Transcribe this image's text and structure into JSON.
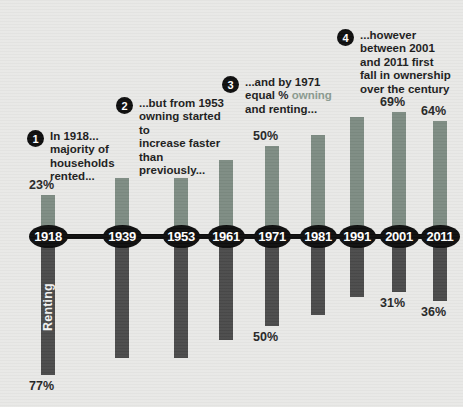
{
  "chart_data": {
    "type": "bar",
    "title": "",
    "subtitle": "",
    "xlabel": "",
    "ylabel": "",
    "categories": [
      "1918",
      "1939",
      "1953",
      "1961",
      "1971",
      "1981",
      "1991",
      "2001",
      "2011"
    ],
    "series": [
      {
        "name": "Owning",
        "values": [
          23,
          32,
          32,
          42,
          50,
          56,
          66,
          69,
          64
        ]
      },
      {
        "name": "Renting",
        "values": [
          77,
          68,
          68,
          58,
          50,
          44,
          34,
          31,
          36
        ]
      }
    ],
    "value_labels": {
      "owning": [
        "23%",
        "",
        "",
        "",
        "50%",
        "",
        "",
        "69%",
        "64%"
      ],
      "renting": [
        "77%",
        "",
        "",
        "",
        "50%",
        "",
        "",
        "31%",
        "36%"
      ]
    },
    "ylim": [
      -100,
      100
    ],
    "grid": false,
    "legend_position": "none",
    "inline_label": "Renting",
    "colors": {
      "owning": "#7d8b82",
      "renting": "#4a4a4a",
      "axis": "#0d0d0d",
      "background": "#e8e8e6",
      "highlight": "#8a9a8f"
    }
  },
  "annotations": [
    {
      "number": "1",
      "text": "In 1918...\nmajority of\nhouseholds\nrented..."
    },
    {
      "number": "2",
      "text": "...but from 1953\nowning started to\nincrease faster\nthan previously..."
    },
    {
      "number": "3",
      "pre": "...and by 1971\nequal % ",
      "hl": "owning",
      "post": "\nand renting..."
    },
    {
      "number": "4",
      "text": "...however\nbetween 2001\nand 2011 first\nfall in ownership\nover the century"
    }
  ],
  "caption": ""
}
